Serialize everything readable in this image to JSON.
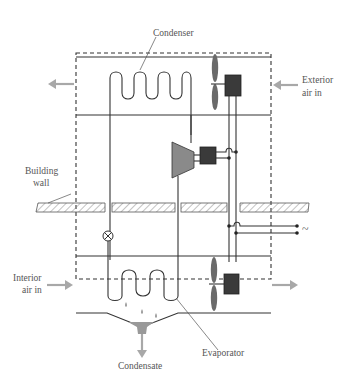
{
  "diagram": {
    "labels": {
      "condenser": "Condenser",
      "exterior_air_line1": "Exterior",
      "exterior_air_line2": "air in",
      "building_wall_line1": "Building",
      "building_wall_line2": "wall",
      "interior_air_line1": "Interior",
      "interior_air_line2": "air in",
      "evaporator": "Evaporator",
      "condensate": "Condensate",
      "ac_supply": "~"
    },
    "colors": {
      "line": "#333333",
      "motor": "#3a3a3a",
      "compressor": "#8a8a8a",
      "air_arrow": "#a8a8a8",
      "label_text": "#555555"
    },
    "components": [
      "condenser-coil",
      "condenser-fan",
      "condenser-fan-motor",
      "compressor",
      "compressor-motor",
      "expansion-valve",
      "evaporator-coil",
      "evaporator-fan",
      "evaporator-fan-motor",
      "drain-pan",
      "building-wall"
    ]
  }
}
